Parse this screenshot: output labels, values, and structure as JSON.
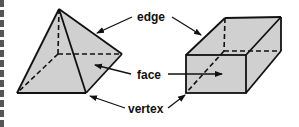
{
  "diagram": {
    "labels": {
      "edge": "edge",
      "face": "face",
      "vertex": "vertex"
    },
    "shapes": [
      "pyramid",
      "rectangular-prism"
    ],
    "colors": {
      "fill": "#cfcfcf",
      "stroke": "#111111",
      "left_bar": "#555555"
    }
  }
}
